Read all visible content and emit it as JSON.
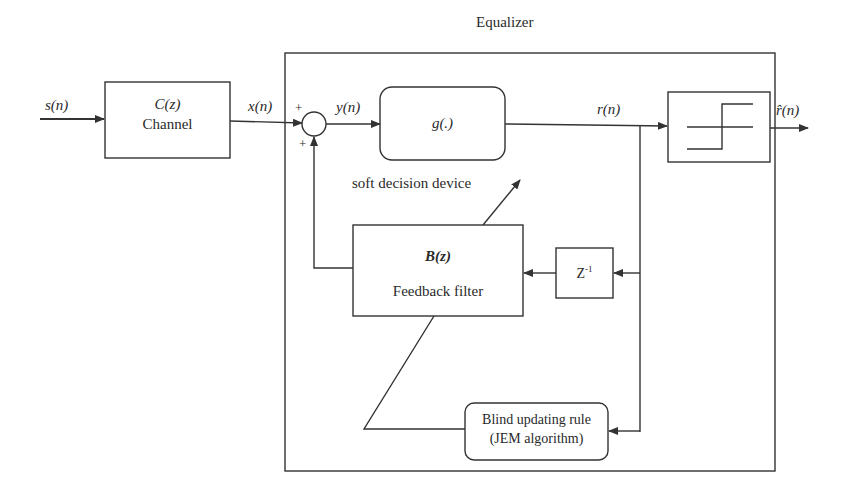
{
  "diagram": {
    "title": "Equalizer",
    "signals": {
      "input": "s(n)",
      "channel_out": "x(n)",
      "sum_out": "y(n)",
      "soft_out": "r(n)",
      "decision_out": "r̂(n)"
    },
    "summer": {
      "plus_top": "+",
      "plus_bottom": "+"
    },
    "blocks": {
      "channel": {
        "symbol": "C(z)",
        "label": "Channel"
      },
      "soft_decision": {
        "symbol": "g(.)",
        "caption": "soft decision device"
      },
      "hard_decision": {
        "icon": "step-function"
      },
      "feedback_filter": {
        "symbol": "B(z)",
        "label": "Feedback filter"
      },
      "delay": {
        "symbol": "Z",
        "exponent": "-1"
      },
      "update_rule": {
        "line1": "Blind updating rule",
        "line2": "(JEM algorithm)"
      }
    },
    "colors": {
      "line": "#333333",
      "background": "#ffffff",
      "text": "#2a2a2a"
    }
  }
}
